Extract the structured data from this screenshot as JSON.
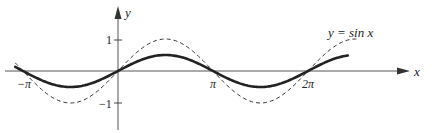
{
  "chart_data": {
    "type": "line",
    "title": "",
    "xlabel": "x",
    "ylabel": "y",
    "x_ticks": [
      {
        "value": -3.14159,
        "label": "−π"
      },
      {
        "value": 3.14159,
        "label": "π"
      },
      {
        "value": 6.28318,
        "label": "2π"
      }
    ],
    "y_ticks": [
      {
        "value": 1,
        "label": "1"
      },
      {
        "value": -1,
        "label": "−1"
      }
    ],
    "xlim": [
      -3.5,
      8.2
    ],
    "ylim": [
      -1.9,
      2.0
    ],
    "grid": false,
    "series": [
      {
        "name": "y = sin x",
        "style": "dashed",
        "function": "sin(x)",
        "x_range": [
          -3.4,
          7.9
        ],
        "x": [
          -3.14,
          -1.57,
          0,
          1.57,
          3.14,
          4.71,
          6.28,
          7.85
        ],
        "values": [
          0,
          -1,
          0,
          1,
          0,
          -1,
          0,
          1
        ]
      },
      {
        "name": "solid curve (0.5 sin x)",
        "style": "solid",
        "function": "0.5*sin(x)",
        "x_range": [
          -3.4,
          7.6
        ],
        "x": [
          -3.14,
          -1.57,
          0,
          1.57,
          3.14,
          4.71,
          6.28,
          7.85
        ],
        "values": [
          0,
          -0.5,
          0,
          0.5,
          0,
          -0.5,
          0,
          0.5
        ]
      }
    ],
    "annotations": [
      {
        "text": "y = sin x",
        "near_series": "y = sin x"
      }
    ]
  },
  "labels": {
    "x_axis": "x",
    "y_axis": "y",
    "neg_pi": "−π",
    "pi": "π",
    "two_pi": "2π",
    "one": "1",
    "neg_one": "−1",
    "curve_label": "y = sin x"
  },
  "colors": {
    "axis": "#555555",
    "curve": "#222222"
  }
}
